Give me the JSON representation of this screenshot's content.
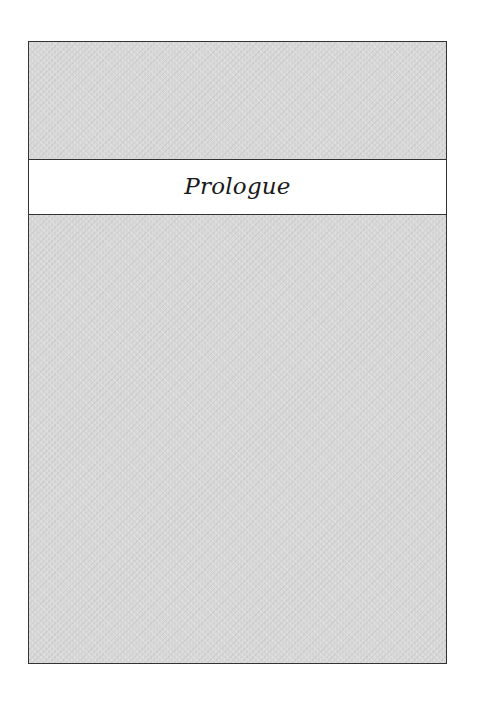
{
  "page": {
    "chapter_title": "Prologue"
  },
  "colors": {
    "frame_fill": "#d6d6d6",
    "frame_border": "#333333",
    "band_fill": "#ffffff",
    "title_text": "#1a1a1a"
  }
}
